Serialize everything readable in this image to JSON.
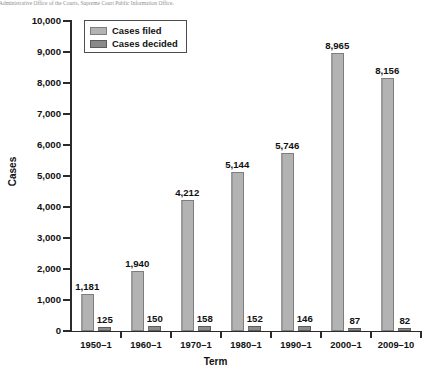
{
  "source_note": "e: Administrative Office of the Courts, Supreme Court Public Information Office.",
  "legend": {
    "position": "top-left-inside",
    "items": [
      {
        "label": "Cases filed",
        "color": "#b3b3b3",
        "icon": "square-swatch-icon"
      },
      {
        "label": "Cases decided",
        "color": "#8a8a8a",
        "icon": "square-swatch-icon"
      }
    ]
  },
  "axes": {
    "y_title": "Cases",
    "x_title": "Term",
    "y_ticks": [
      "0",
      "1,000",
      "2,000",
      "3,000",
      "4,000",
      "5,000",
      "6,000",
      "7,000",
      "8,000",
      "9,000",
      "10,000"
    ]
  },
  "chart_data": {
    "type": "bar",
    "title": "",
    "subtitle": "",
    "xlabel": "Term",
    "ylabel": "Cases",
    "ylim": [
      0,
      10000
    ],
    "ytick_step": 1000,
    "grid": false,
    "legend_position": "upper left",
    "categories": [
      "1950–1",
      "1960–1",
      "1970–1",
      "1980–1",
      "1990–1",
      "2000–1",
      "2009–10"
    ],
    "series": [
      {
        "name": "Cases filed",
        "color": "#b3b3b3",
        "values": [
          1181,
          1940,
          4212,
          5144,
          5746,
          8965,
          8156
        ],
        "labels": [
          "1,181",
          "1,940",
          "4,212",
          "5,144",
          "5,746",
          "8,965",
          "8,156"
        ]
      },
      {
        "name": "Cases decided",
        "color": "#8a8a8a",
        "values": [
          125,
          150,
          158,
          152,
          146,
          87,
          82
        ],
        "labels": [
          "125",
          "150",
          "158",
          "152",
          "146",
          "87",
          "82"
        ]
      }
    ]
  }
}
